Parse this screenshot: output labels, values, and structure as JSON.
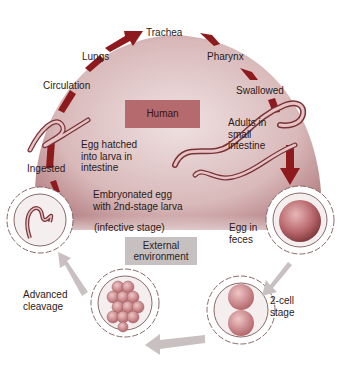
{
  "diagram": {
    "type": "life-cycle",
    "colors": {
      "host_region": "#c99ea0",
      "host_region_light": "#efe1e1",
      "arrow_dark_red": "#8e1a1e",
      "arrow_gray": "#c9c1c1",
      "egg_fill": "#b8676c",
      "label_text": "#2a1a1a"
    },
    "regions": {
      "human": "Human",
      "external": [
        "External",
        "environment"
      ]
    },
    "stages": {
      "trachea": "Trachea",
      "lungs": "Lungs",
      "pharynx": "Pharynx",
      "circulation": "Circulation",
      "swallowed": "Swallowed",
      "adults": [
        "Adults in",
        "small",
        "intestine"
      ],
      "hatched": [
        "Egg hatched",
        "into larva in",
        "intestine"
      ],
      "ingested": "Ingested",
      "embryonated": [
        "Embryonated egg",
        "with 2nd-stage larva"
      ],
      "infective": "(infective stage)",
      "egg_feces": [
        "Egg  in",
        "feces"
      ],
      "advanced": [
        "Advanced",
        "cleavage"
      ],
      "two_cell": [
        "2-cell",
        "stage"
      ]
    }
  }
}
